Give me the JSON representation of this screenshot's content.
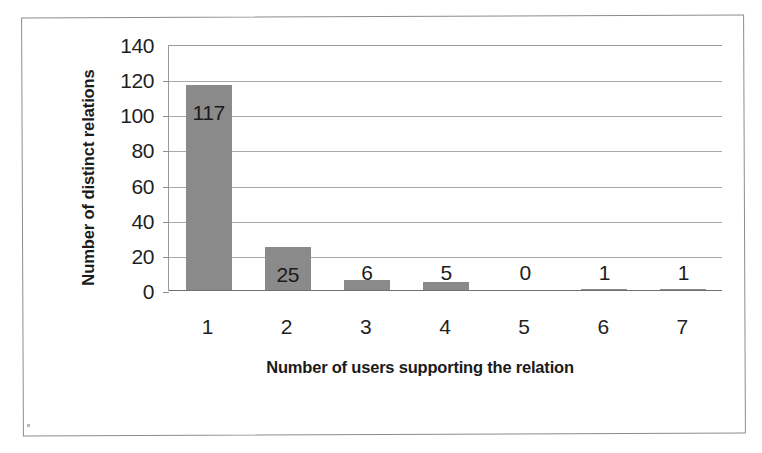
{
  "chart_data": {
    "type": "bar",
    "title": "",
    "subtitle": "",
    "xlabel": "Number of users supporting the relation",
    "ylabel": "Number of distinct relations",
    "categories": [
      "1",
      "2",
      "3",
      "4",
      "5",
      "6",
      "7"
    ],
    "values": [
      117,
      25,
      6,
      5,
      0,
      1,
      1
    ],
    "data_labels": [
      "117",
      "25",
      "6",
      "5",
      "0",
      "1",
      "1"
    ],
    "series": [
      {
        "name": "Number of distinct relations",
        "values": [
          117,
          25,
          6,
          5,
          0,
          1,
          1
        ],
        "color": "#8a8a8a"
      }
    ],
    "ylim": [
      0,
      140
    ],
    "ytick_step": 20,
    "ytick_labels": [
      "140",
      "120",
      "100",
      "80",
      "60",
      "40",
      "20",
      "0"
    ],
    "ytick_values": [
      140,
      120,
      100,
      80,
      60,
      40,
      20,
      0
    ],
    "xtick_labels": [
      "1",
      "2",
      "3",
      "4",
      "5",
      "6",
      "7"
    ],
    "grid": "horizontal",
    "legend": "none",
    "legend_position": "none",
    "bar_color": "#8a8a8a",
    "plot_background": "#ffffff",
    "gridline_color": "#a9a9a9",
    "axis_color": "#707070",
    "text_color": "#1b1b1b"
  },
  "figure": {
    "border_color": "#8c8c8c",
    "background": "#ffffff"
  }
}
